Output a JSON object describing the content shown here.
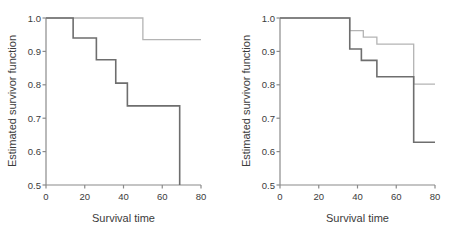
{
  "figure": {
    "background": "#ffffff",
    "panel_count": 2
  },
  "chart_data": [
    {
      "type": "line",
      "title": "",
      "panel": "left",
      "xlabel": "Survival time",
      "ylabel": "Estimated survivor function",
      "xlim": [
        0,
        80
      ],
      "ylim": [
        0.5,
        1.0
      ],
      "xticks": [
        0,
        20,
        40,
        60,
        80
      ],
      "xtick_labels": [
        "0",
        "20",
        "40",
        "60",
        "80"
      ],
      "yticks": [
        0.5,
        0.6,
        0.7,
        0.8,
        0.9,
        1.0
      ],
      "ytick_labels": [
        "0.5",
        "0.6",
        "0.7",
        "0.8",
        "0.9",
        "1.0"
      ],
      "grid": false,
      "legend": "none",
      "series": [
        {
          "name": "group-1",
          "style": "step-post",
          "color": "#6e6e6e",
          "width": 1.6,
          "x": [
            0,
            14,
            14,
            26,
            26,
            36,
            36,
            42,
            42,
            69,
            69
          ],
          "y": [
            1.0,
            1.0,
            0.94,
            0.94,
            0.875,
            0.875,
            0.805,
            0.805,
            0.737,
            0.737,
            0.5
          ]
        },
        {
          "name": "group-2",
          "style": "step-post",
          "color": "#b4b4b4",
          "width": 1.3,
          "x": [
            0,
            50,
            50,
            80
          ],
          "y": [
            1.0,
            1.0,
            0.935,
            0.935
          ]
        }
      ]
    },
    {
      "type": "line",
      "title": "",
      "panel": "right",
      "xlabel": "Survival time",
      "ylabel": "Estimated survivor function",
      "xlim": [
        0,
        80
      ],
      "ylim": [
        0.5,
        1.0
      ],
      "xticks": [
        0,
        20,
        40,
        60,
        80
      ],
      "xtick_labels": [
        "0",
        "20",
        "40",
        "60",
        "80"
      ],
      "yticks": [
        0.5,
        0.6,
        0.7,
        0.8,
        0.9,
        1.0
      ],
      "ytick_labels": [
        "0.5",
        "0.6",
        "0.7",
        "0.8",
        "0.9",
        "1.0"
      ],
      "grid": false,
      "legend": "none",
      "series": [
        {
          "name": "group-1",
          "style": "step-post",
          "color": "#6e6e6e",
          "width": 1.6,
          "x": [
            0,
            36,
            36,
            42,
            42,
            50,
            50,
            69,
            69,
            80
          ],
          "y": [
            1.0,
            1.0,
            0.907,
            0.907,
            0.873,
            0.873,
            0.824,
            0.824,
            0.628,
            0.628
          ]
        },
        {
          "name": "group-2",
          "style": "step-post",
          "color": "#b4b4b4",
          "width": 1.3,
          "x": [
            0,
            36,
            36,
            43,
            43,
            50,
            50,
            69,
            69,
            80
          ],
          "y": [
            1.0,
            1.0,
            0.962,
            0.962,
            0.943,
            0.943,
            0.922,
            0.922,
            0.802,
            0.802
          ]
        }
      ]
    }
  ],
  "axes": {
    "xlabel": "Survival time",
    "ylabel": "Estimated survivor function",
    "axis_color": "#8a8a8a",
    "tick_color": "#8a8a8a",
    "label_color": "#3b3b3b"
  },
  "left_panel": {
    "xlabel": "Survival time",
    "ylabel": "Estimated survivor function",
    "xtick_labels": [
      "0",
      "20",
      "40",
      "60",
      "80"
    ],
    "ytick_labels": [
      "0.5",
      "0.6",
      "0.7",
      "0.8",
      "0.9",
      "1.0"
    ]
  },
  "right_panel": {
    "xlabel": "Survival time",
    "ylabel": "Estimated survivor function",
    "xtick_labels": [
      "0",
      "20",
      "40",
      "60",
      "80"
    ],
    "ytick_labels": [
      "0.5",
      "0.6",
      "0.7",
      "0.8",
      "0.9",
      "1.0"
    ]
  }
}
